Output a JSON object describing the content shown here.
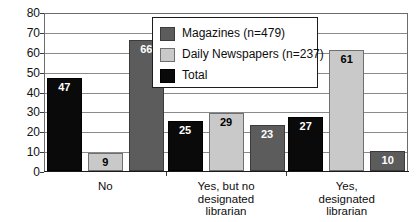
{
  "chart_data": {
    "type": "bar",
    "title": "",
    "subtitle": "",
    "xlabel": "",
    "ylabel": "",
    "ylim": [
      0,
      80
    ],
    "yticks": [
      0,
      10,
      20,
      30,
      40,
      50,
      60,
      70,
      80
    ],
    "grid": true,
    "legend_position": "top-center",
    "categories": [
      "No",
      "Yes, but no designated librarian",
      "Yes, designated librarian"
    ],
    "category_lines": [
      [
        "No"
      ],
      [
        "Yes, but no",
        "designated",
        "librarian"
      ],
      [
        "Yes,",
        "designated",
        "librarian"
      ]
    ],
    "series": [
      {
        "name": "Magazines (n=479)",
        "color": "#5c5c5c",
        "key": "magazines",
        "values": [
          66,
          23,
          10
        ]
      },
      {
        "name": "Daily Newspapers (n=237)",
        "color": "#c9c9c9",
        "key": "daily",
        "values": [
          9,
          29,
          61
        ]
      },
      {
        "name": "Total",
        "color": "#0a0a0a",
        "key": "total",
        "values": [
          47,
          25,
          27
        ]
      }
    ],
    "bars": [
      {
        "group": 0,
        "series": "total",
        "label": "47",
        "value": 47
      },
      {
        "group": 0,
        "series": "daily",
        "label": "9",
        "value": 9
      },
      {
        "group": 0,
        "series": "magazines",
        "label": "66",
        "value": 66
      },
      {
        "group": 1,
        "series": "total",
        "label": "25",
        "value": 25
      },
      {
        "group": 1,
        "series": "daily",
        "label": "29",
        "value": 29
      },
      {
        "group": 1,
        "series": "magazines",
        "label": "23",
        "value": 23
      },
      {
        "group": 2,
        "series": "total",
        "label": "27",
        "value": 27
      },
      {
        "group": 2,
        "series": "daily",
        "label": "61",
        "value": 61
      },
      {
        "group": 2,
        "series": "magazines",
        "label": "10",
        "value": 10
      }
    ]
  },
  "legend": {
    "items": [
      {
        "label": "Magazines (n=479)",
        "swatch": "magazines"
      },
      {
        "label": "Daily Newspapers (n=237)",
        "swatch": "daily"
      },
      {
        "label": "Total",
        "swatch": "total"
      }
    ]
  },
  "axis": {
    "y_tick_labels": [
      "80",
      "70",
      "60",
      "50",
      "40",
      "30",
      "20",
      "10",
      "0"
    ]
  },
  "colors": {
    "magazines": "#5c5c5c",
    "daily": "#c9c9c9",
    "total": "#0a0a0a",
    "grid": "#8a8a8a",
    "frame": "#6b6b6b",
    "text": "#0d0d0d"
  }
}
